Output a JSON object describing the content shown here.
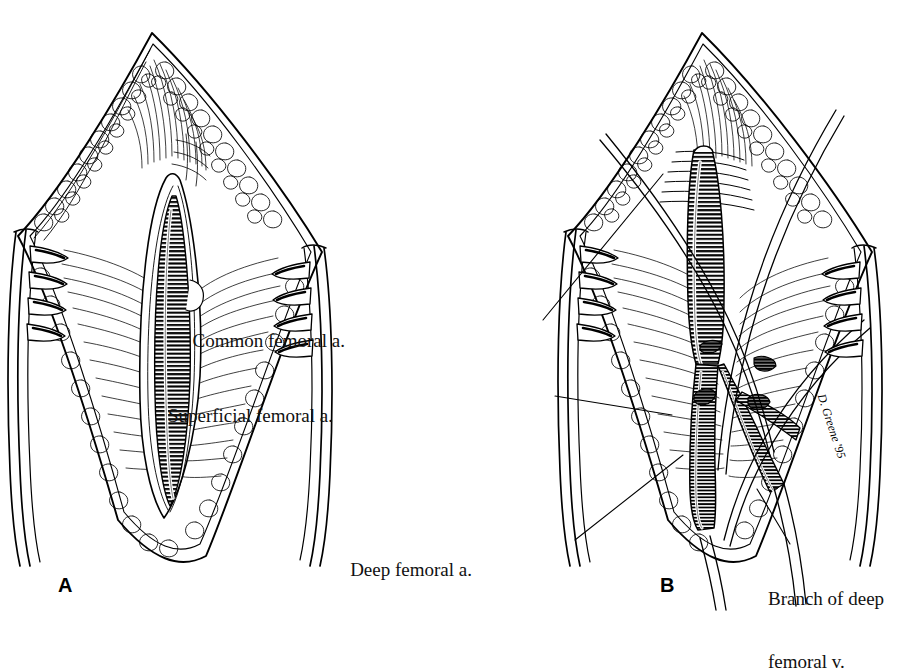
{
  "figure": {
    "type": "surgical-illustration",
    "technique": "pen-and-ink line drawing",
    "background_color": "#ffffff",
    "ink_color": "#000000"
  },
  "panels": [
    {
      "id": "A",
      "letter": "A",
      "caption": "",
      "description": "Vertical groin incision retracted open exposing the common femoral artery within the femoral sheath",
      "structures": [
        "skin edge",
        "subcutaneous fat",
        "femoral sheath",
        "common femoral artery",
        "self-retaining retractor blade, left",
        "self-retaining retractor blade, right"
      ]
    },
    {
      "id": "B",
      "letter": "B",
      "caption": "",
      "description": "Same exposure after dissection, with vessel loops encircling the common femoral artery, superficial femoral artery, deep femoral artery and a branch of the deep femoral vein",
      "structures": [
        "common femoral artery",
        "superficial femoral artery",
        "deep femoral artery",
        "branch of deep femoral vein",
        "vessel loops",
        "retractor blades"
      ]
    }
  ],
  "labels": [
    {
      "id": "common-femoral-a",
      "text": "Common femoral a.",
      "lines": [
        "Common femoral a."
      ],
      "x": 345,
      "y": 310,
      "align": "right",
      "leader_from": [
        543,
        320
      ],
      "leader_to": [
        663,
        174
      ]
    },
    {
      "id": "superficial-femoral-a",
      "text": "Superficial femoral a.",
      "lines": [
        "Superficial femoral a."
      ],
      "x": 333,
      "y": 385,
      "align": "right",
      "leader_from": [
        555,
        396
      ],
      "leader_to": [
        672,
        415
      ]
    },
    {
      "id": "deep-femoral-a",
      "text": "Deep femoral a.",
      "lines": [
        "Deep femoral a."
      ],
      "x": 472,
      "y": 540,
      "align": "right",
      "leader_from": [
        575,
        540
      ],
      "leader_to": [
        683,
        455
      ]
    },
    {
      "id": "branch-of-deep-femoral-v",
      "text": "Branch of deep femoral v.",
      "lines": [
        "Branch of deep",
        "femoral v."
      ],
      "x": 768,
      "y": 548,
      "align": "left",
      "leader_from": [
        790,
        544
      ],
      "leader_to": [
        757,
        489
      ]
    }
  ],
  "panel_letters": [
    {
      "id": "A",
      "text": "A",
      "x": 58,
      "y": 574
    },
    {
      "id": "B",
      "text": "B",
      "x": 660,
      "y": 574
    }
  ],
  "signature": {
    "text": "D. Greene '95",
    "x": 828,
    "y": 392
  }
}
